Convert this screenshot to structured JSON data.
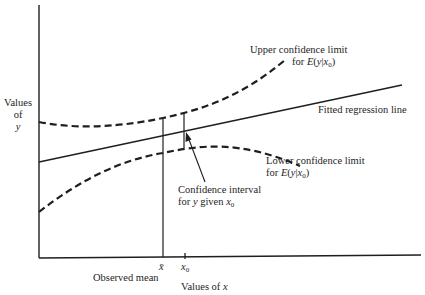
{
  "diagram": {
    "type": "regression-confidence-limits",
    "axes": {
      "y_label_line1": "Values",
      "y_label_line2": "of",
      "y_label_line3": "y",
      "x_label_text": "Values of ",
      "x_label_var": "x"
    },
    "ticks": {
      "xbar": "x̄",
      "x0_var": "x",
      "x0_sub": "0"
    },
    "annotations": {
      "upper_line1": "Upper confidence limit",
      "upper_line2_pre": "for ",
      "upper_line2_E": "E",
      "upper_line2_open": "(",
      "upper_line2_y": "y",
      "upper_line2_bar": "|",
      "upper_line2_x": "x",
      "upper_line2_sub": "0",
      "upper_line2_close": ")",
      "fitted": "Fitted regression line",
      "lower_line1": "Lower confidence limit",
      "lower_line2_pre": "for ",
      "lower_line2_E": "E",
      "lower_line2_open": "(",
      "lower_line2_y": "y",
      "lower_line2_bar": "|",
      "lower_line2_x": "x",
      "lower_line2_sub": "0",
      "lower_line2_close": ")",
      "ci_line1": "Confidence interval",
      "ci_line2_pre": "for ",
      "ci_line2_y": "y",
      "ci_line2_mid": " given ",
      "ci_line2_x": "x",
      "ci_line2_sub": "0",
      "observed_mean": "Observed mean"
    },
    "colors": {
      "ink": "#1e1e1e",
      "background": "#ffffff"
    }
  }
}
